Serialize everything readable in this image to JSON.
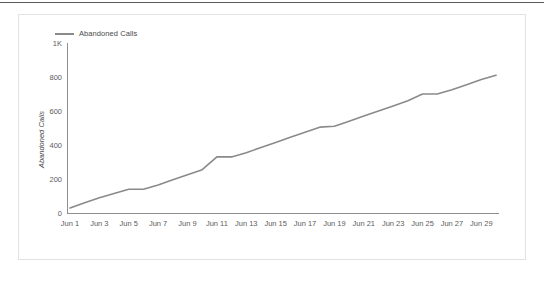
{
  "chart_data": {
    "type": "line",
    "title": "",
    "xlabel": "",
    "ylabel": "Abandoned Calls",
    "ylim": [
      0,
      1000
    ],
    "grid": false,
    "legend_position": "top-left",
    "y_ticks": [
      {
        "value": 0,
        "label": "0"
      },
      {
        "value": 200,
        "label": "200"
      },
      {
        "value": 400,
        "label": "400"
      },
      {
        "value": 600,
        "label": "600"
      },
      {
        "value": 800,
        "label": "800"
      },
      {
        "value": 1000,
        "label": "1K"
      }
    ],
    "x_tick_labels": [
      "Jun 1",
      "Jun 3",
      "Jun 5",
      "Jun 7",
      "Jun 9",
      "Jun 11",
      "Jun 13",
      "Jun 15",
      "Jun 17",
      "Jun 19",
      "Jun 21",
      "Jun 23",
      "Jun 25",
      "Jun 27",
      "Jun 29"
    ],
    "x": [
      "Jun 1",
      "Jun 2",
      "Jun 3",
      "Jun 4",
      "Jun 5",
      "Jun 6",
      "Jun 7",
      "Jun 8",
      "Jun 9",
      "Jun 10",
      "Jun 11",
      "Jun 12",
      "Jun 13",
      "Jun 14",
      "Jun 15",
      "Jun 16",
      "Jun 17",
      "Jun 18",
      "Jun 19",
      "Jun 20",
      "Jun 21",
      "Jun 22",
      "Jun 23",
      "Jun 24",
      "Jun 25",
      "Jun 26",
      "Jun 27",
      "Jun 28",
      "Jun 29",
      "Jun 30"
    ],
    "series": [
      {
        "name": "Abandoned Calls",
        "color": "#8a8a8a",
        "values": [
          30,
          60,
          90,
          115,
          140,
          140,
          165,
          195,
          225,
          255,
          330,
          330,
          355,
          385,
          415,
          445,
          475,
          505,
          510,
          540,
          570,
          600,
          630,
          660,
          700,
          700,
          725,
          755,
          785,
          810
        ]
      }
    ]
  },
  "legend": {
    "entries": [
      {
        "label": "Abandoned Calls"
      }
    ]
  },
  "axes": {
    "y_title": "Abandoned Calls"
  },
  "colors": {
    "line": "#8a8a8a",
    "axis": "#8f8f8f",
    "text": "#5c5c5c",
    "card_border": "#e2e2e2",
    "top_rule": "#5b5b5b",
    "background": "#ffffff"
  }
}
